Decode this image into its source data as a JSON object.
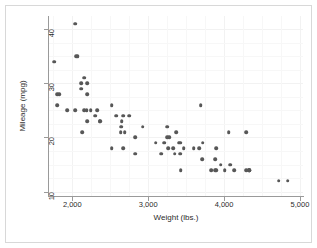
{
  "chart_data": {
    "type": "scatter",
    "title": "",
    "xlabel": "Weight (lbs.)",
    "ylabel": "Mileage (mpg)",
    "xlim": [
      1680,
      5040
    ],
    "ylim": [
      9.2,
      42.4
    ],
    "xticks": [
      2000,
      3000,
      4000,
      5000
    ],
    "xticklabels": [
      "2,000",
      "3,000",
      "4,000",
      "5,000"
    ],
    "yticks": [
      10,
      20,
      30,
      40
    ],
    "yticklabels": [
      "10",
      "20",
      "30",
      "40"
    ],
    "grid": true,
    "legend": null,
    "marker_color": "#575757",
    "background_color": "#ffffff",
    "grid_color": "#f2f2f2",
    "axis_color": "#9a9a9a",
    "n_points": 74,
    "points": [
      {
        "x": 2930,
        "y": 22
      },
      {
        "x": 3350,
        "y": 17
      },
      {
        "x": 2640,
        "y": 22
      },
      {
        "x": 3250,
        "y": 20
      },
      {
        "x": 4080,
        "y": 15
      },
      {
        "x": 3670,
        "y": 18
      },
      {
        "x": 3690,
        "y": 26
      },
      {
        "x": 3280,
        "y": 20
      },
      {
        "x": 3880,
        "y": 16
      },
      {
        "x": 3400,
        "y": 19
      },
      {
        "x": 4330,
        "y": 14
      },
      {
        "x": 3900,
        "y": 14
      },
      {
        "x": 4290,
        "y": 21
      },
      {
        "x": 4330,
        "y": 14
      },
      {
        "x": 3370,
        "y": 21
      },
      {
        "x": 4130,
        "y": 14
      },
      {
        "x": 4060,
        "y": 21
      },
      {
        "x": 3720,
        "y": 19
      },
      {
        "x": 3955,
        "y": 15
      },
      {
        "x": 3830,
        "y": 14
      },
      {
        "x": 4010,
        "y": 14
      },
      {
        "x": 3900,
        "y": 18
      },
      {
        "x": 4290,
        "y": 14
      },
      {
        "x": 3420,
        "y": 19
      },
      {
        "x": 3885,
        "y": 14
      },
      {
        "x": 3470,
        "y": 18
      },
      {
        "x": 3710,
        "y": 16
      },
      {
        "x": 3100,
        "y": 19
      },
      {
        "x": 2830,
        "y": 20
      },
      {
        "x": 3250,
        "y": 22
      },
      {
        "x": 2580,
        "y": 24
      },
      {
        "x": 3430,
        "y": 14
      },
      {
        "x": 3260,
        "y": 18
      },
      {
        "x": 2200,
        "y": 28
      },
      {
        "x": 4330,
        "y": 14
      },
      {
        "x": 3600,
        "y": 18
      },
      {
        "x": 3330,
        "y": 18
      },
      {
        "x": 2690,
        "y": 21
      },
      {
        "x": 2360,
        "y": 23
      },
      {
        "x": 2050,
        "y": 35
      },
      {
        "x": 2520,
        "y": 26
      },
      {
        "x": 2300,
        "y": 24
      },
      {
        "x": 2330,
        "y": 25
      },
      {
        "x": 2200,
        "y": 23
      },
      {
        "x": 2670,
        "y": 24
      },
      {
        "x": 2750,
        "y": 24
      },
      {
        "x": 2130,
        "y": 21
      },
      {
        "x": 2650,
        "y": 23
      },
      {
        "x": 2115,
        "y": 30
      },
      {
        "x": 1800,
        "y": 28
      },
      {
        "x": 2120,
        "y": 29
      },
      {
        "x": 1800,
        "y": 26
      },
      {
        "x": 1760,
        "y": 34
      },
      {
        "x": 2040,
        "y": 25
      },
      {
        "x": 1930,
        "y": 25
      },
      {
        "x": 2520,
        "y": 18
      },
      {
        "x": 2830,
        "y": 17
      },
      {
        "x": 2650,
        "y": 22
      },
      {
        "x": 2640,
        "y": 21
      },
      {
        "x": 2370,
        "y": 23
      },
      {
        "x": 2160,
        "y": 25
      },
      {
        "x": 2670,
        "y": 18
      },
      {
        "x": 2160,
        "y": 31
      },
      {
        "x": 2040,
        "y": 41
      },
      {
        "x": 1830,
        "y": 28
      },
      {
        "x": 2200,
        "y": 30
      },
      {
        "x": 2070,
        "y": 35
      },
      {
        "x": 2190,
        "y": 25
      },
      {
        "x": 3420,
        "y": 17
      },
      {
        "x": 3170,
        "y": 17
      },
      {
        "x": 3210,
        "y": 19
      },
      {
        "x": 4720,
        "y": 12
      },
      {
        "x": 4840,
        "y": 12
      },
      {
        "x": 2240,
        "y": 25
      }
    ]
  }
}
